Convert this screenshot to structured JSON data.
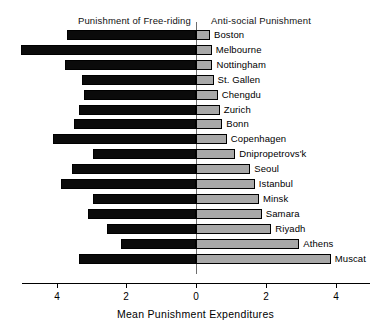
{
  "chart_data": {
    "type": "bar",
    "title": "",
    "subtitle": "",
    "xlabel": "Mean Punishment Expenditures",
    "ylabel": "",
    "orientation": "horizontal",
    "style": "diverging-bidirectional",
    "grid": false,
    "legend_position": "top-headers",
    "zero_position_px": 196,
    "px_per_unit": 35,
    "axis": {
      "tick_values": [
        4,
        2,
        0,
        2,
        4
      ],
      "tick_labels": [
        "4",
        "2",
        "0",
        "2",
        "4"
      ],
      "tick_px": [
        57,
        126,
        196,
        266,
        336
      ],
      "left_axis_max": 5.0,
      "right_axis_max": 5.0
    },
    "headers": {
      "left": "Punishment of Free-riding",
      "right": "Anti-social Punishment"
    },
    "series": [
      {
        "name": "Punishment of Free-riding",
        "side": "left",
        "color": "#0b0b0b",
        "values": [
          3.7,
          5.0,
          3.75,
          3.25,
          3.2,
          3.35,
          3.5,
          4.1,
          2.95,
          3.55,
          3.85,
          2.95,
          3.1,
          2.55,
          2.15,
          3.35
        ]
      },
      {
        "name": "Anti-social Punishment",
        "side": "right",
        "color": "#a8a8a8",
        "values": [
          0.4,
          0.45,
          0.47,
          0.5,
          0.62,
          0.68,
          0.75,
          0.88,
          1.12,
          1.55,
          1.68,
          1.8,
          1.88,
          2.15,
          2.95,
          3.85
        ]
      }
    ],
    "categories": [
      "Boston",
      "Melbourne",
      "Nottingham",
      "St. Gallen",
      "Chengdu",
      "Zurich",
      "Bonn",
      "Copenhagen",
      "Dnipropetrovs'k",
      "Seoul",
      "Istanbul",
      "Minsk",
      "Samara",
      "Riyadh",
      "Athens",
      "Muscat"
    ],
    "colors": {
      "left_bar": "#0b0b0b",
      "right_bar": "#a8a8a8",
      "bar_outline": "#000000",
      "axis": "#000000",
      "zero_line": "#6d6d6d",
      "background": "#ffffff",
      "text": "#000000"
    }
  }
}
